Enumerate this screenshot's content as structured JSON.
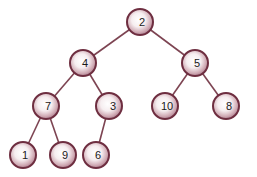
{
  "diagram": {
    "type": "binary-tree",
    "colors": {
      "edge": "#7d4452",
      "node_border": "#6e2e40",
      "node_fill_center": "#ffffff",
      "node_fill_edge": "#b58a96",
      "label": "#1a1a1a"
    },
    "nodes": [
      {
        "id": "n2",
        "label": "2",
        "x": 140,
        "y": 22
      },
      {
        "id": "n4",
        "label": "4",
        "x": 83,
        "y": 63
      },
      {
        "id": "n5",
        "label": "5",
        "x": 195,
        "y": 63
      },
      {
        "id": "n7",
        "label": "7",
        "x": 46,
        "y": 106
      },
      {
        "id": "n3",
        "label": "3",
        "x": 109,
        "y": 106
      },
      {
        "id": "n10",
        "label": "10",
        "x": 165,
        "y": 106
      },
      {
        "id": "n8",
        "label": "8",
        "x": 226,
        "y": 106
      },
      {
        "id": "n1",
        "label": "1",
        "x": 23,
        "y": 155
      },
      {
        "id": "n9",
        "label": "9",
        "x": 63,
        "y": 155
      },
      {
        "id": "n6",
        "label": "6",
        "x": 96,
        "y": 155
      }
    ],
    "edges": [
      {
        "from": "n2",
        "to": "n4"
      },
      {
        "from": "n2",
        "to": "n5"
      },
      {
        "from": "n4",
        "to": "n7"
      },
      {
        "from": "n4",
        "to": "n3"
      },
      {
        "from": "n5",
        "to": "n10"
      },
      {
        "from": "n5",
        "to": "n8"
      },
      {
        "from": "n7",
        "to": "n1"
      },
      {
        "from": "n7",
        "to": "n9"
      },
      {
        "from": "n3",
        "to": "n6"
      }
    ]
  }
}
